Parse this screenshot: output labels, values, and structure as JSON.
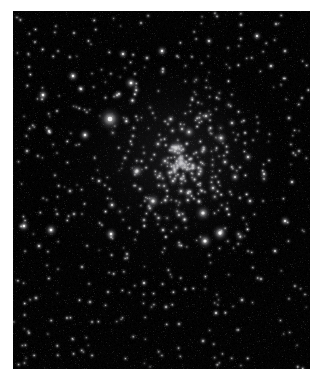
{
  "page": {
    "background_color": "#ffffff",
    "width": 329,
    "height": 387
  },
  "image_panel": {
    "name": "star-cluster-photograph",
    "alt_text": "Dense open star cluster on black sky background",
    "background_color": "#000000",
    "x": 13,
    "y": 11,
    "width": 297,
    "height": 358
  },
  "side_bar": {
    "name": "vertical-gray-bar",
    "color": "#7d7d7d",
    "highlight_color": "#cfcfcf",
    "x": 320,
    "y": 113,
    "width": 9,
    "height": 97
  },
  "chart_data": {
    "type": "scatter",
    "title": "",
    "subtitle": "",
    "xlabel": "",
    "ylabel": "",
    "xlim": [
      0,
      297
    ],
    "ylim": [
      0,
      358
    ],
    "grid": false,
    "legend": null,
    "background": "#000000",
    "point_color": "#ffffff",
    "cluster_center": {
      "x": 168,
      "y": 152
    },
    "cluster_radius": 95,
    "brightest_star": {
      "x": 97,
      "y": 108,
      "r": 4.2,
      "b": 1.0
    },
    "stars": [
      {
        "x": 97,
        "y": 108,
        "r": 4.2,
        "b": 1.0
      },
      {
        "x": 163,
        "y": 137,
        "r": 3.0,
        "b": 0.95
      },
      {
        "x": 190,
        "y": 202,
        "r": 2.9,
        "b": 0.94
      },
      {
        "x": 207,
        "y": 222,
        "r": 3.0,
        "b": 0.96
      },
      {
        "x": 192,
        "y": 230,
        "r": 2.8,
        "b": 0.92
      },
      {
        "x": 140,
        "y": 190,
        "r": 2.8,
        "b": 0.93
      },
      {
        "x": 208,
        "y": 127,
        "r": 2.4,
        "b": 0.88
      },
      {
        "x": 176,
        "y": 121,
        "r": 2.3,
        "b": 0.86
      },
      {
        "x": 124,
        "y": 160,
        "r": 2.6,
        "b": 0.9
      },
      {
        "x": 118,
        "y": 72,
        "r": 2.4,
        "b": 0.87
      },
      {
        "x": 60,
        "y": 65,
        "r": 2.2,
        "b": 0.84
      },
      {
        "x": 68,
        "y": 78,
        "r": 1.8,
        "b": 0.74
      },
      {
        "x": 30,
        "y": 84,
        "r": 2.2,
        "b": 0.85
      },
      {
        "x": 36,
        "y": 120,
        "r": 1.7,
        "b": 0.72
      },
      {
        "x": 72,
        "y": 124,
        "r": 2.3,
        "b": 0.86
      },
      {
        "x": 110,
        "y": 43,
        "r": 1.9,
        "b": 0.76
      },
      {
        "x": 149,
        "y": 40,
        "r": 2.1,
        "b": 0.82
      },
      {
        "x": 134,
        "y": 47,
        "r": 1.5,
        "b": 0.66
      },
      {
        "x": 196,
        "y": 30,
        "r": 1.7,
        "b": 0.71
      },
      {
        "x": 244,
        "y": 25,
        "r": 1.9,
        "b": 0.77
      },
      {
        "x": 258,
        "y": 55,
        "r": 1.6,
        "b": 0.69
      },
      {
        "x": 272,
        "y": 40,
        "r": 1.5,
        "b": 0.65
      },
      {
        "x": 228,
        "y": 14,
        "r": 1.5,
        "b": 0.64
      },
      {
        "x": 263,
        "y": 13,
        "r": 1.4,
        "b": 0.62
      },
      {
        "x": 128,
        "y": 12,
        "r": 1.3,
        "b": 0.58
      },
      {
        "x": 61,
        "y": 22,
        "r": 1.3,
        "b": 0.58
      },
      {
        "x": 22,
        "y": 31,
        "r": 1.2,
        "b": 0.55
      },
      {
        "x": 16,
        "y": 56,
        "r": 1.3,
        "b": 0.58
      },
      {
        "x": 44,
        "y": 100,
        "r": 1.3,
        "b": 0.57
      },
      {
        "x": 14,
        "y": 140,
        "r": 1.5,
        "b": 0.65
      },
      {
        "x": 11,
        "y": 215,
        "r": 2.2,
        "b": 0.84
      },
      {
        "x": 38,
        "y": 219,
        "r": 2.4,
        "b": 0.88
      },
      {
        "x": 26,
        "y": 235,
        "r": 1.6,
        "b": 0.68
      },
      {
        "x": 23,
        "y": 287,
        "r": 1.5,
        "b": 0.64
      },
      {
        "x": 16,
        "y": 322,
        "r": 1.3,
        "b": 0.57
      },
      {
        "x": 54,
        "y": 307,
        "r": 1.3,
        "b": 0.57
      },
      {
        "x": 77,
        "y": 291,
        "r": 1.4,
        "b": 0.62
      },
      {
        "x": 95,
        "y": 281,
        "r": 1.3,
        "b": 0.58
      },
      {
        "x": 69,
        "y": 256,
        "r": 1.4,
        "b": 0.61
      },
      {
        "x": 98,
        "y": 223,
        "r": 2.3,
        "b": 0.86
      },
      {
        "x": 99,
        "y": 194,
        "r": 1.9,
        "b": 0.78
      },
      {
        "x": 86,
        "y": 170,
        "r": 1.6,
        "b": 0.69
      },
      {
        "x": 57,
        "y": 180,
        "r": 1.5,
        "b": 0.65
      },
      {
        "x": 61,
        "y": 203,
        "r": 1.4,
        "b": 0.62
      },
      {
        "x": 114,
        "y": 243,
        "r": 1.4,
        "b": 0.61
      },
      {
        "x": 131,
        "y": 272,
        "r": 1.6,
        "b": 0.69
      },
      {
        "x": 153,
        "y": 296,
        "r": 1.5,
        "b": 0.65
      },
      {
        "x": 166,
        "y": 313,
        "r": 1.4,
        "b": 0.6
      },
      {
        "x": 190,
        "y": 330,
        "r": 1.5,
        "b": 0.64
      },
      {
        "x": 203,
        "y": 302,
        "r": 1.6,
        "b": 0.7
      },
      {
        "x": 229,
        "y": 289,
        "r": 1.5,
        "b": 0.65
      },
      {
        "x": 248,
        "y": 268,
        "r": 1.4,
        "b": 0.61
      },
      {
        "x": 262,
        "y": 240,
        "r": 1.6,
        "b": 0.68
      },
      {
        "x": 272,
        "y": 210,
        "r": 2.0,
        "b": 0.8
      },
      {
        "x": 279,
        "y": 171,
        "r": 1.6,
        "b": 0.69
      },
      {
        "x": 286,
        "y": 140,
        "r": 1.4,
        "b": 0.61
      },
      {
        "x": 276,
        "y": 107,
        "r": 1.5,
        "b": 0.65
      },
      {
        "x": 289,
        "y": 87,
        "r": 1.3,
        "b": 0.57
      },
      {
        "x": 251,
        "y": 163,
        "r": 1.7,
        "b": 0.72
      },
      {
        "x": 235,
        "y": 146,
        "r": 1.9,
        "b": 0.78
      },
      {
        "x": 222,
        "y": 166,
        "r": 2.0,
        "b": 0.8
      },
      {
        "x": 212,
        "y": 151,
        "r": 1.8,
        "b": 0.75
      },
      {
        "x": 200,
        "y": 177,
        "r": 1.9,
        "b": 0.78
      },
      {
        "x": 186,
        "y": 163,
        "r": 1.8,
        "b": 0.76
      },
      {
        "x": 175,
        "y": 182,
        "r": 2.0,
        "b": 0.81
      },
      {
        "x": 160,
        "y": 170,
        "r": 1.9,
        "b": 0.78
      },
      {
        "x": 152,
        "y": 150,
        "r": 2.0,
        "b": 0.8
      },
      {
        "x": 145,
        "y": 133,
        "r": 1.8,
        "b": 0.75
      },
      {
        "x": 169,
        "y": 118,
        "r": 1.7,
        "b": 0.72
      },
      {
        "x": 193,
        "y": 105,
        "r": 1.9,
        "b": 0.78
      },
      {
        "x": 219,
        "y": 112,
        "r": 1.7,
        "b": 0.72
      },
      {
        "x": 237,
        "y": 190,
        "r": 1.7,
        "b": 0.72
      },
      {
        "x": 214,
        "y": 198,
        "r": 1.6,
        "b": 0.69
      },
      {
        "x": 166,
        "y": 204,
        "r": 1.7,
        "b": 0.71
      },
      {
        "x": 150,
        "y": 219,
        "r": 1.6,
        "b": 0.68
      },
      {
        "x": 131,
        "y": 209,
        "r": 1.5,
        "b": 0.65
      },
      {
        "x": 127,
        "y": 178,
        "r": 1.6,
        "b": 0.69
      },
      {
        "x": 112,
        "y": 147,
        "r": 1.5,
        "b": 0.66
      },
      {
        "x": 120,
        "y": 125,
        "r": 1.4,
        "b": 0.62
      }
    ]
  }
}
